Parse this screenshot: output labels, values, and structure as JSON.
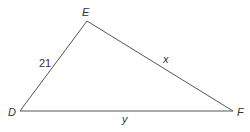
{
  "diagram": {
    "type": "triangle",
    "vertices": [
      {
        "id": "E",
        "label": "E",
        "x": 87,
        "y": 21,
        "label_x": 82,
        "label_y": 16
      },
      {
        "id": "D",
        "label": "D",
        "x": 20,
        "y": 111,
        "label_x": 8,
        "label_y": 116
      },
      {
        "id": "F",
        "label": "F",
        "x": 233,
        "y": 111,
        "label_x": 237,
        "label_y": 116
      }
    ],
    "sides": [
      {
        "id": "DE",
        "from": "D",
        "to": "E",
        "label": "21",
        "italic": false,
        "label_x": 39,
        "label_y": 67
      },
      {
        "id": "EF",
        "from": "E",
        "to": "F",
        "label": "x",
        "italic": true,
        "label_x": 163,
        "label_y": 63
      },
      {
        "id": "DF",
        "from": "D",
        "to": "F",
        "label": "y",
        "italic": true,
        "label_x": 122,
        "label_y": 123
      }
    ],
    "colors": {
      "line": "#555555",
      "text": "#333333",
      "background": "#ffffff"
    }
  }
}
